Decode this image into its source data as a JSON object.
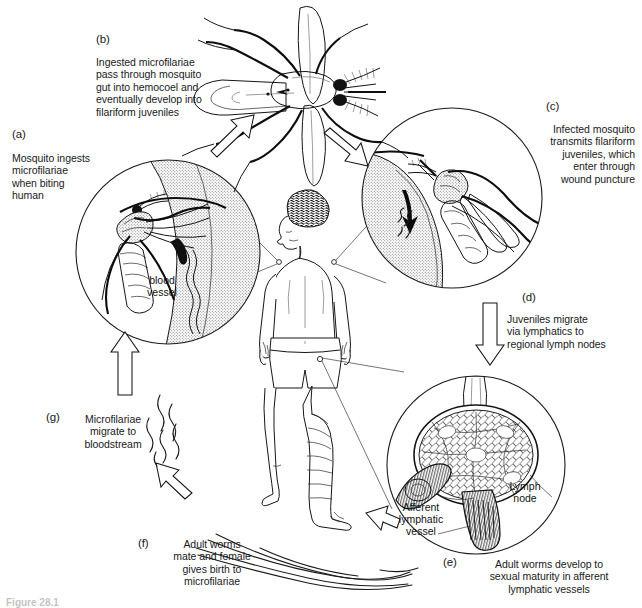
{
  "figure": {
    "caption": "Figure 28.1"
  },
  "steps": [
    {
      "key": "a",
      "marker": "(a)",
      "text": "Mosquito ingests\nmicrofilariae\nwhen biting\nhuman",
      "align": "left"
    },
    {
      "key": "b",
      "marker": "(b)",
      "text": "Ingested microfilariae\npass through mosquito\ngut into hemocoel and\neventually develop into\nfilariform juveniles",
      "align": "left"
    },
    {
      "key": "c",
      "marker": "(c)",
      "text": "Infected mosquito\ntransmits filariform\njuveniles, which\nenter through\nwound puncture",
      "align": "right"
    },
    {
      "key": "d",
      "marker": "(d)",
      "text": "Juveniles migrate\nvia lymphatics to\nregional lymph nodes",
      "align": "left"
    },
    {
      "key": "e",
      "marker": "(e)",
      "text": "Adult worms develop to\nsexual maturity in afferent\nlymphatic vessels",
      "align": "center"
    },
    {
      "key": "f",
      "marker": "(f)",
      "text": "Adult worms\nmate and female\ngives birth to\nmicrofilariae",
      "align": "center"
    },
    {
      "key": "g",
      "marker": "(g)",
      "text": "Microfilariae\nmigrate to\nbloodstream",
      "align": "center"
    }
  ],
  "annotations": {
    "blood_vessel": "blood\nvessel",
    "lymph_node": "Lymph\nnode",
    "afferent_vessel": "Afferent\nlymphatic\nvessel"
  },
  "colors": {
    "ink": "#141414",
    "paper": "#ffffff",
    "stipple": "#6f6f6f"
  }
}
